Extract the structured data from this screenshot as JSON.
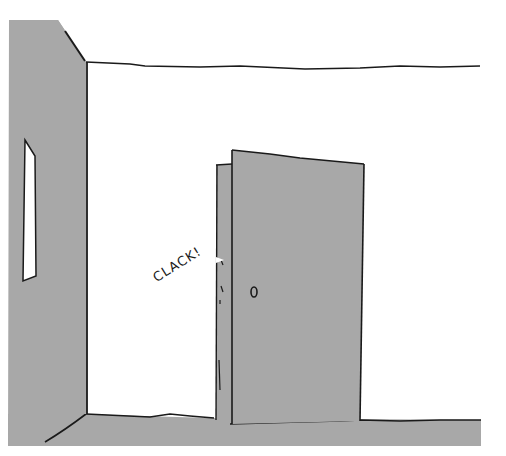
{
  "illustration": {
    "sound_effect": "CLACK!",
    "colors": {
      "fill_gray": "#a8a8a8",
      "ink": "#1a1a1a",
      "background": "#ffffff"
    },
    "elements": [
      "left-wall",
      "wall-window",
      "ceiling-line",
      "floor",
      "door-ajar",
      "door-edge",
      "doorknob"
    ]
  }
}
